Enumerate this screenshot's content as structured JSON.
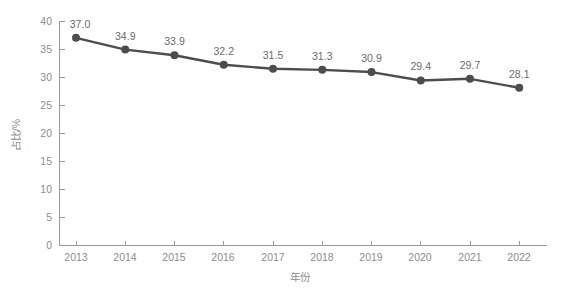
{
  "chart_data": {
    "type": "line",
    "title": "",
    "xlabel": "年份",
    "ylabel": "占比/%",
    "categories": [
      "2013",
      "2014",
      "2015",
      "2016",
      "2017",
      "2018",
      "2019",
      "2020",
      "2021",
      "2022"
    ],
    "values": [
      37.0,
      34.9,
      33.9,
      32.2,
      31.5,
      31.3,
      30.9,
      29.4,
      29.7,
      28.1
    ],
    "point_labels": [
      "37.0",
      "34.9",
      "33.9",
      "32.2",
      "31.5",
      "31.3",
      "30.9",
      "29.4",
      "29.7",
      "28.1"
    ],
    "ylim": [
      0,
      40
    ],
    "yticks": [
      0,
      5,
      10,
      15,
      20,
      25,
      30,
      35,
      40
    ],
    "ytick_labels": [
      "0",
      "5",
      "10",
      "15",
      "20",
      "25",
      "30",
      "35",
      "40"
    ],
    "xlim_categories": [
      "2013",
      "2022"
    ],
    "grid": false,
    "legend": false,
    "legend_position": "none",
    "series": [
      {
        "name": "占比/%",
        "values": [
          37.0,
          34.9,
          33.9,
          32.2,
          31.5,
          31.3,
          30.9,
          29.4,
          29.7,
          28.1
        ],
        "line_color": "#4d4d4d",
        "marker_color": "#4d4d4d",
        "marker": "circle"
      }
    ],
    "colors": {
      "line": "#4d4d4d",
      "marker": "#4d4d4d",
      "axis": "#9a9a9a",
      "tick_text": "#8c8c8c",
      "label_text": "#6b6b6b",
      "background": "#ffffff"
    }
  },
  "caption": ""
}
